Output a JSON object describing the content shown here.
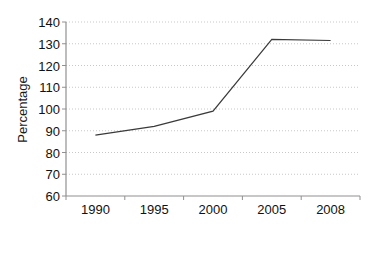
{
  "chart_data": {
    "type": "line",
    "title": "",
    "xlabel": "",
    "ylabel": "Percentage",
    "categories": [
      "1990",
      "1995",
      "2000",
      "2005",
      "2008"
    ],
    "values": [
      88,
      92,
      99,
      132,
      131.5
    ],
    "series": [
      {
        "name": "Percentage",
        "values": [
          88,
          92,
          99,
          132,
          131.5
        ]
      }
    ],
    "ylim": [
      60,
      140
    ],
    "yticks": [
      60,
      70,
      80,
      90,
      100,
      110,
      120,
      130,
      140
    ],
    "ytick_labels": [
      "60",
      "70",
      "80",
      "90",
      "100",
      "110",
      "120",
      "130",
      "140"
    ],
    "grid": true,
    "grid_axis": "y",
    "grid_style": "dotted",
    "legend": false,
    "markers": false,
    "colors": {
      "line": "#3a3a3a",
      "grid": "#c8c8c8",
      "axis": "#808080",
      "text": "#111111",
      "background": "#ffffff"
    }
  },
  "axis": {
    "y_title": "Percentage"
  }
}
